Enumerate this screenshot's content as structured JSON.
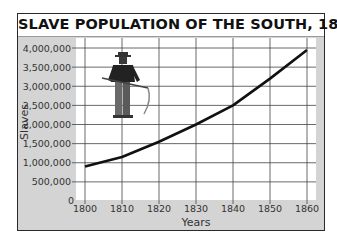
{
  "chart_data": {
    "type": "line",
    "title": "SLAVE POPULATION OF THE SOUTH, 1800–1860",
    "xlabel": "Years",
    "ylabel": "Slaves",
    "categories": [
      "1800",
      "1810",
      "1820",
      "1830",
      "1840",
      "1850",
      "1860"
    ],
    "series": [
      {
        "name": "Slave population",
        "values": [
          900000,
          1150000,
          1550000,
          2000000,
          2500000,
          3200000,
          3950000
        ]
      }
    ],
    "y_ticks": [
      "0",
      "500,000",
      "1,000,000",
      "1,500,000",
      "2,000,000",
      "2,500,000",
      "3,000,000",
      "3,500,000",
      "4,000,000"
    ],
    "ylim": [
      0,
      4000000
    ],
    "grid": true,
    "legend": "none",
    "illustration": "farm-worker-with-scythe"
  },
  "colors": {
    "line": "#111111",
    "grid": "#444444",
    "plot_bg": "#ffffff",
    "frame_bg": "#d4d4d4"
  }
}
